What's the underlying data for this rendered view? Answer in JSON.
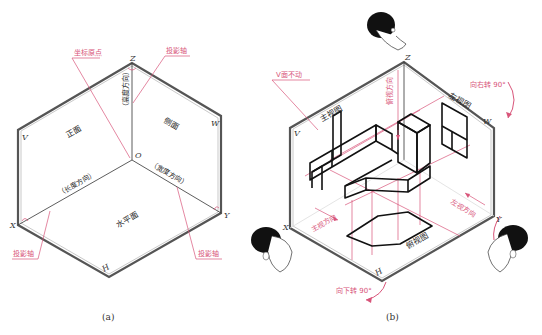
{
  "figure_a": {
    "caption": "(a)",
    "axis_labels": {
      "z": "Z",
      "x": "X",
      "y": "Y",
      "o": "O",
      "v": "V",
      "w": "W",
      "h": "H"
    },
    "planes": {
      "front": "正面",
      "side": "侧面",
      "horizontal": "水平面"
    },
    "directions": {
      "height": "（高度方向）",
      "length": "（长度方向）",
      "width": "（宽度方向）"
    },
    "callouts": {
      "origin": "坐标原点",
      "proj_axis_top": "投影轴",
      "proj_axis_left": "投影轴",
      "proj_axis_right": "投影轴"
    }
  },
  "figure_b": {
    "caption": "(b)",
    "axis_labels": {
      "z": "Z",
      "x": "X",
      "y": "Y",
      "v": "V",
      "w": "W",
      "h": "H"
    },
    "views": {
      "front": "主视图",
      "left": "左视图",
      "top": "俯视图"
    },
    "directions": {
      "front": "主视方向",
      "top": "俯视方向",
      "left": "左视方向"
    },
    "callouts": {
      "v_fixed": "V面不动",
      "rotate_right": "向右转 90°",
      "rotate_down": "向下转 90°"
    }
  },
  "colors": {
    "annotation": "#d8557a",
    "ink": "#111111",
    "frame": "#555555"
  }
}
